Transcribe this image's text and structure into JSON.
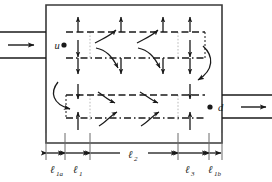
{
  "diagram": {
    "colors": {
      "stroke": "#1a1a1a",
      "faint": "#b8b8b8",
      "background": "#ffffff"
    },
    "ports": {
      "inlet": {
        "label": "u",
        "marker": "filled-dot",
        "arrow": "flow-arrow-right"
      },
      "outlet": {
        "label": "d",
        "marker": "filled-dot",
        "arrow": "flow-arrow-right"
      }
    },
    "dimensions": [
      {
        "key": "l1a",
        "label": "ℓ",
        "sub": "1a",
        "x0": 46,
        "x1": 65
      },
      {
        "key": "l1",
        "label": "ℓ",
        "sub": "1",
        "x0": 65,
        "x1": 90
      },
      {
        "key": "l2",
        "label": "ℓ",
        "sub": "2",
        "x0": 90,
        "x1": 178
      },
      {
        "key": "l3",
        "label": "ℓ",
        "sub": "3",
        "x0": 178,
        "x1": 209
      },
      {
        "key": "l1b",
        "label": "ℓ",
        "sub": "1b",
        "x0": 209,
        "x1": 222
      }
    ],
    "channels": {
      "upper_top_y": 32,
      "upper_bot_y": 58,
      "lower_top_y": 95,
      "lower_bot_y": 118
    },
    "body": {
      "x": 46,
      "y": 5,
      "width": 176,
      "height": 138
    },
    "cross_flow_arrows": {
      "up_row_x": [
        78,
        121,
        163,
        190
      ],
      "down_row_x": [
        78,
        121,
        163,
        190
      ],
      "lower_down_x": [
        78,
        190
      ],
      "lower_up_x": [
        78,
        190
      ]
    },
    "icons": {
      "inlet_arrow": "arrow-right-icon",
      "outlet_arrow": "arrow-right-icon",
      "turn_left": "curved-arrow-down-left-icon",
      "turn_right": "curved-arrow-down-right-icon"
    }
  }
}
